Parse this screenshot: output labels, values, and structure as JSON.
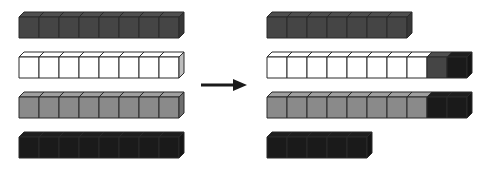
{
  "diagram": {
    "colors": {
      "dark_gray": "#454545",
      "white": "#ffffff",
      "gray": "#8a8a8a",
      "black": "#1a1a1a",
      "outline": "#2a2a2a"
    },
    "arrow": {
      "direction": "right",
      "color": "#1a1a1a"
    },
    "before": {
      "rows": [
        {
          "cubes": [
            "dark_gray",
            "dark_gray",
            "dark_gray",
            "dark_gray",
            "dark_gray",
            "dark_gray",
            "dark_gray",
            "dark_gray"
          ]
        },
        {
          "cubes": [
            "white",
            "white",
            "white",
            "white",
            "white",
            "white",
            "white",
            "white"
          ]
        },
        {
          "cubes": [
            "gray",
            "gray",
            "gray",
            "gray",
            "gray",
            "gray",
            "gray",
            "gray"
          ]
        },
        {
          "cubes": [
            "black",
            "black",
            "black",
            "black",
            "black",
            "black",
            "black",
            "black"
          ]
        }
      ]
    },
    "after": {
      "rows": [
        {
          "cubes": [
            "dark_gray",
            "dark_gray",
            "dark_gray",
            "dark_gray",
            "dark_gray",
            "dark_gray",
            "dark_gray"
          ]
        },
        {
          "cubes": [
            "white",
            "white",
            "white",
            "white",
            "white",
            "white",
            "white",
            "white",
            "dark_gray",
            "black"
          ]
        },
        {
          "cubes": [
            "gray",
            "gray",
            "gray",
            "gray",
            "gray",
            "gray",
            "gray",
            "gray",
            "black",
            "black"
          ]
        },
        {
          "cubes": [
            "black",
            "black",
            "black",
            "black",
            "black"
          ]
        }
      ]
    }
  }
}
